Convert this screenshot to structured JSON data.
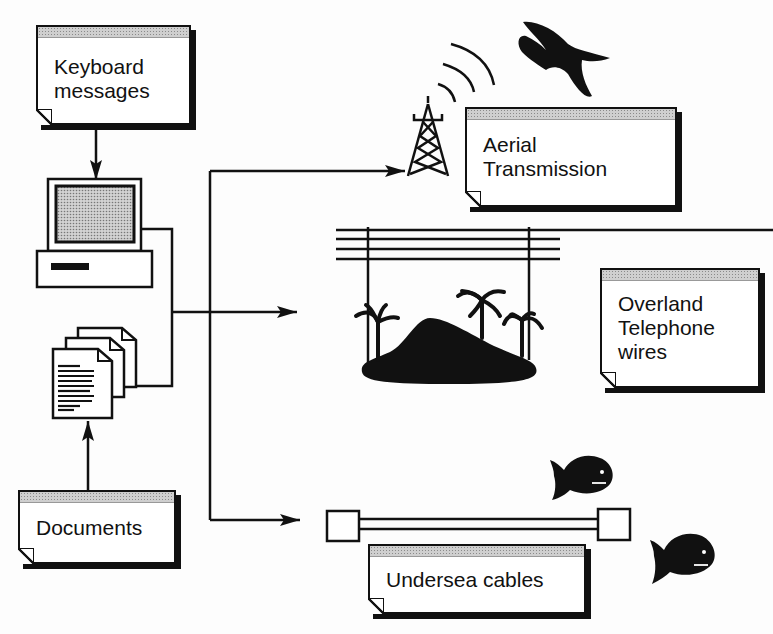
{
  "diagram": {
    "nodes": {
      "keyboard": {
        "label": "Keyboard\nmessages"
      },
      "documents": {
        "label": "Documents"
      },
      "aerial": {
        "label": "Aerial\nTransmission"
      },
      "overland": {
        "label": "Overland\nTelephone\nwires"
      },
      "undersea": {
        "label": "Undersea cables"
      }
    },
    "icons": [
      "computer-icon",
      "document-stack-icon",
      "radio-tower-icon",
      "signal-waves-icon",
      "bird-icon",
      "telephone-wires-icon",
      "island-icon",
      "palm-tree-icon",
      "cable-icon",
      "fish-icon"
    ],
    "edges": [
      {
        "from": "keyboard",
        "to": "computer"
      },
      {
        "from": "documents",
        "to": "document-stack"
      },
      {
        "from": "computer+document-stack",
        "to": "aerial"
      },
      {
        "from": "computer+document-stack",
        "to": "overland"
      },
      {
        "from": "computer+document-stack",
        "to": "undersea"
      }
    ],
    "colors": {
      "ink": "#111111",
      "paper": "#ffffff",
      "screen": "#b8b8b8"
    }
  }
}
